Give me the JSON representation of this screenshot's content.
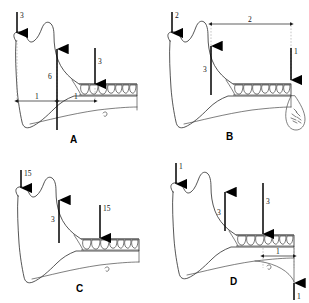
{
  "figure": {
    "width": 309,
    "height": 303,
    "background": "#ffffff",
    "ink_color": "#2b2b2b",
    "arrow_color": "#000000",
    "guide_color": "#8a8a8a"
  },
  "panels": [
    {
      "id": "A",
      "letter": "A",
      "arrows": [
        {
          "name": "condyle-down-arrow",
          "label": "3",
          "direction": "down",
          "location": "condyle-superior"
        },
        {
          "name": "ramus-up-arrow",
          "label": "6",
          "direction": "up",
          "location": "ramus-body-vertical"
        },
        {
          "name": "molar-down-arrow",
          "label": "3",
          "direction": "down",
          "location": "posterior-teeth"
        }
      ],
      "dimensions": [
        {
          "name": "dimension-left",
          "label": "1",
          "orientation": "horizontal"
        },
        {
          "name": "dimension-right",
          "label": "1",
          "orientation": "horizontal"
        }
      ]
    },
    {
      "id": "B",
      "letter": "B",
      "arrows": [
        {
          "name": "condyle-down-arrow",
          "label": "2",
          "direction": "down",
          "location": "condyle-superior"
        },
        {
          "name": "ramus-up-arrow",
          "label": "3",
          "direction": "up",
          "location": "ramus-anterior"
        },
        {
          "name": "anterior-down-arrow",
          "label": "1",
          "direction": "down",
          "location": "anterior-teeth"
        }
      ],
      "dimensions": [
        {
          "name": "dimension-span",
          "label": "2",
          "orientation": "horizontal"
        }
      ]
    },
    {
      "id": "C",
      "letter": "C",
      "arrows": [
        {
          "name": "condyle-down-arrow",
          "label": "15",
          "direction": "down",
          "location": "condyle-superior"
        },
        {
          "name": "ramus-up-arrow",
          "label": "3",
          "direction": "up",
          "location": "ramus-anterior"
        },
        {
          "name": "molar-down-arrow",
          "label": "15",
          "direction": "down",
          "location": "posterior-teeth"
        }
      ],
      "dimensions": []
    },
    {
      "id": "D",
      "letter": "D",
      "arrows": [
        {
          "name": "condyle-down-arrow",
          "label": "1",
          "direction": "down",
          "location": "condyle-superior"
        },
        {
          "name": "ramus-up-arrow",
          "label": "3",
          "direction": "up",
          "location": "ramus-anterior"
        },
        {
          "name": "molar-down-arrow",
          "label": "3",
          "direction": "down",
          "location": "posterior-teeth"
        },
        {
          "name": "angle-up-arrow",
          "label": "1",
          "direction": "up",
          "location": "mandibular-angle-inferior"
        }
      ],
      "dimensions": [
        {
          "name": "dimension-span",
          "label": "1",
          "orientation": "horizontal"
        }
      ]
    }
  ]
}
